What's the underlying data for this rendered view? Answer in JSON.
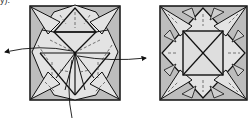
{
  "diagram": {
    "type": "origami-folding-step",
    "caption_fragment": "y).",
    "colors": {
      "paper_dark": "#bdbdbd",
      "paper_light": "#e3e3e3",
      "line": "#111111",
      "crease": "#555555"
    },
    "panels": [
      {
        "name": "before",
        "description": "square base with radial creases, arrows indicating flaps to open"
      },
      {
        "name": "after",
        "description": "square with inner square and X diagonals, star points"
      }
    ],
    "arrows": [
      {
        "panel": "before",
        "direction": "left"
      },
      {
        "panel": "before",
        "direction": "right"
      },
      {
        "panel": "before",
        "direction": "down"
      }
    ]
  }
}
